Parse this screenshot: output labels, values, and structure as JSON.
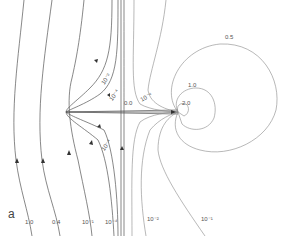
{
  "figure": {
    "panel_label": "a",
    "colors": {
      "line": "#555555",
      "light_line": "#888888",
      "background": "#ffffff"
    },
    "streamline_labels_bottom": [
      "1.0",
      "0.4",
      "10⁻¹",
      "10⁻⁴",
      "10⁻²",
      "10⁻¹"
    ],
    "inner_labels": [
      "10⁻²",
      "10⁻⁴",
      "0.0",
      "10⁻⁴",
      "10⁻⁴"
    ],
    "contour_labels": [
      "0.5",
      "1.0",
      "2.0"
    ]
  }
}
